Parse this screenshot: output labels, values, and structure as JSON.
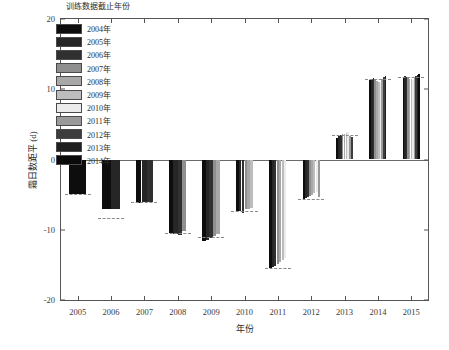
{
  "chart_data": {
    "type": "bar",
    "title": "",
    "xlabel": "年份",
    "ylabel": "霜日数距平 (d)",
    "legend_title": "训练数据截止年份",
    "legend_position": "upper-left-inside",
    "grid": false,
    "ylim": [
      -20,
      20
    ],
    "yticks": [
      -20,
      -10,
      0,
      10,
      20
    ],
    "ytick_labels": [
      "-20",
      "-10",
      "0",
      "10",
      "20"
    ],
    "categories": [
      "2005",
      "2006",
      "2007",
      "2008",
      "2009",
      "2010",
      "2011",
      "2012",
      "2013",
      "2014",
      "2015"
    ],
    "xtick_labels": [
      "2005",
      "2006",
      "2007",
      "2008",
      "2009",
      "2010",
      "2011",
      "2012",
      "2013",
      "2014",
      "2015"
    ],
    "series": [
      {
        "name": "2004年",
        "color": "#0d0d0d",
        "values": [
          -4.9,
          -7.1,
          -6.2,
          -10.4,
          -11.6,
          -7.3,
          -15.5,
          -5.6,
          3.1,
          11.3,
          11.6
        ]
      },
      {
        "name": "2005年",
        "color": "#262626",
        "values": [
          null,
          -7.0,
          -6.1,
          -10.6,
          -11.4,
          -7.4,
          -15.3,
          -5.5,
          3.3,
          11.5,
          11.9
        ]
      },
      {
        "name": "2006年",
        "color": "#303030",
        "values": [
          null,
          null,
          -6.0,
          -10.8,
          -11.2,
          -7.6,
          -15.2,
          -5.4,
          3.5,
          11.6,
          11.8
        ]
      },
      {
        "name": "2007年",
        "color": "#8f8f8f",
        "values": [
          null,
          null,
          null,
          -10.2,
          -10.9,
          -7.1,
          -14.9,
          -5.2,
          3.6,
          11.4,
          11.7
        ]
      },
      {
        "name": "2008年",
        "color": "#a8a8a8",
        "values": [
          null,
          null,
          null,
          null,
          -10.6,
          -7.0,
          -14.6,
          -5.0,
          3.7,
          11.2,
          11.5
        ]
      },
      {
        "name": "2009年",
        "color": "#bdbdbd",
        "values": [
          null,
          null,
          null,
          null,
          null,
          -6.9,
          -14.3,
          -4.8,
          3.8,
          11.0,
          11.4
        ]
      },
      {
        "name": "2010年",
        "color": "#ebebeb",
        "values": [
          null,
          null,
          null,
          null,
          null,
          null,
          -14.0,
          -4.6,
          3.9,
          10.9,
          11.3
        ]
      },
      {
        "name": "2011年",
        "color": "#9a9a9a",
        "values": [
          null,
          null,
          null,
          null,
          null,
          null,
          null,
          -5.3,
          3.4,
          11.4,
          11.6
        ]
      },
      {
        "name": "2012年",
        "color": "#3d3d3d",
        "values": [
          null,
          null,
          null,
          null,
          null,
          null,
          null,
          null,
          3.2,
          11.7,
          11.9
        ]
      },
      {
        "name": "2013年",
        "color": "#1f1f1f",
        "values": [
          null,
          null,
          null,
          null,
          null,
          null,
          null,
          null,
          null,
          11.9,
          12.0
        ]
      },
      {
        "name": "2014年",
        "color": "#0a0a0a",
        "values": [
          null,
          null,
          null,
          null,
          null,
          null,
          null,
          null,
          null,
          null,
          12.1
        ]
      }
    ],
    "mean_lines": [
      -4.9,
      -8.3,
      -6.1,
      -10.4,
      -11.0,
      -7.3,
      -15.5,
      -5.6,
      3.5,
      11.4,
      11.7
    ]
  }
}
